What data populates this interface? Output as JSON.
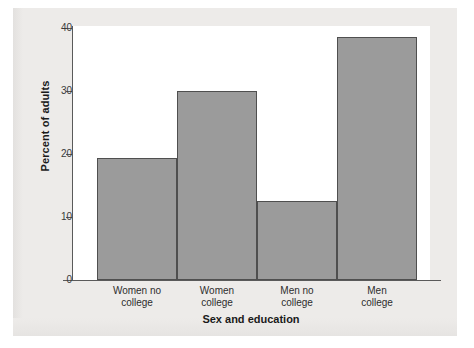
{
  "chart_data": {
    "type": "bar",
    "title": "",
    "xlabel": "Sex and education",
    "ylabel": "Percent of adults",
    "categories": [
      "Women no college",
      "Women college",
      "Men no college",
      "Men college"
    ],
    "category_lines": [
      [
        "Women no",
        "college"
      ],
      [
        "Women",
        "college"
      ],
      [
        "Men no",
        "college"
      ],
      [
        "Men",
        "college"
      ]
    ],
    "values": [
      19.2,
      29.8,
      12.4,
      38.2
    ],
    "ylim": [
      0,
      40
    ],
    "yticks": [
      0,
      10,
      20,
      30,
      40
    ],
    "ytick_labels": [
      "0",
      "10",
      "20",
      "30",
      "40"
    ],
    "grid": false,
    "legend": false,
    "bar_fill_color": "#9b9b9b",
    "bar_edge_color": "#4f4f4f",
    "plot_background_color": "#ffffff",
    "figure_background_color": "#edebe9",
    "axis_color": "#5a5a5a"
  }
}
